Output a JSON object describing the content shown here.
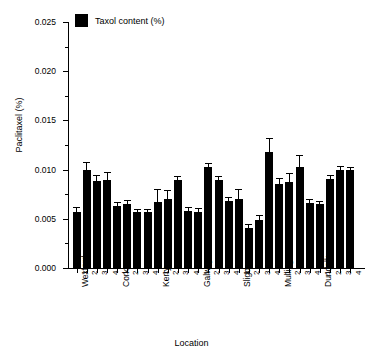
{
  "chart_data": {
    "type": "bar",
    "title": "",
    "xlabel": "Location",
    "ylabel": "Paclitaxel (%)",
    "ylim": [
      0.0,
      0.025
    ],
    "ytick_labels": [
      "0.000",
      "0.005",
      "0.010",
      "0.015",
      "0.020",
      "0.025"
    ],
    "ytick_values": [
      0.0,
      0.005,
      0.01,
      0.015,
      0.02,
      0.025
    ],
    "minor_tick_values": [
      0.0025,
      0.0075,
      0.0125,
      0.0175,
      0.0225
    ],
    "grid": false,
    "legend_position": "top-left",
    "legend": [
      "Taxol content (%)"
    ],
    "series_name": "Taxol content (%)",
    "bar_color": "#000000",
    "error_bars": "upper-only with caps",
    "group_labels": [
      "Wexford",
      "Cork",
      "Kerry",
      "Galway",
      "Sligo",
      "Mullingar",
      "Dundalk"
    ],
    "sample_labels": [
      "1",
      "2",
      "3",
      "4"
    ],
    "categories": [
      "Wexford 1",
      "Wexford 2",
      "Wexford 3",
      "Wexford 4",
      "Cork 1",
      "Cork 2",
      "Cork 3",
      "Cork 4",
      "Kerry 1",
      "Kerry 2",
      "Kerry 3",
      "Kerry 4",
      "Galway 1",
      "Galway 2",
      "Galway 3",
      "Galway 4",
      "Sligo 1",
      "Sligo 2",
      "Sligo 3",
      "Sligo 4",
      "Mullingar 1",
      "Mullingar 2",
      "Mullingar 3",
      "Mullingar 4",
      "Dundalk 1",
      "Dundalk 2",
      "Dundalk 3",
      "Dundalk 4"
    ],
    "values": [
      0.0057,
      0.01,
      0.0088,
      0.0089,
      0.0063,
      0.0065,
      0.0057,
      0.0057,
      0.0067,
      0.007,
      0.0089,
      0.0058,
      0.0057,
      0.0103,
      0.0089,
      0.0068,
      0.007,
      0.0041,
      0.0049,
      0.0118,
      0.0085,
      0.0087,
      0.0103,
      0.0066,
      0.0065,
      0.009,
      0.01,
      0.01
    ],
    "errors": [
      0.0004,
      0.0007,
      0.0006,
      0.0008,
      0.0003,
      0.0003,
      0.0002,
      0.0002,
      0.0012,
      0.0008,
      0.0004,
      0.0003,
      0.0003,
      0.0003,
      0.0004,
      0.0003,
      0.0009,
      0.0003,
      0.0004,
      0.0013,
      0.0005,
      0.0009,
      0.0011,
      0.0003,
      0.0002,
      0.0004,
      0.0003,
      0.0002
    ]
  },
  "axis": {
    "ytitle": "Paclitaxel (%)",
    "xtitle": "Location"
  },
  "legend": {
    "label": "Taxol content (%)"
  }
}
